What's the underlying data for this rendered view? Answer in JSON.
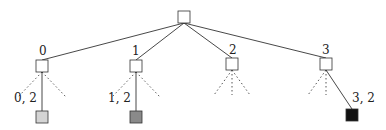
{
  "diagram": {
    "type": "tree",
    "root": {
      "x": 184,
      "y": 17,
      "size": 12,
      "fill": "#ffffff"
    },
    "children": [
      {
        "label": "0",
        "x": 42,
        "y": 66,
        "label_x": 39,
        "label_y": 55,
        "leaf": {
          "label": "0, 2",
          "x": 42,
          "y": 117,
          "fill": "#d4d4d4",
          "label_x": 14,
          "label_y": 102
        },
        "dotted": [
          [
            -24,
            25
          ],
          [
            24,
            25
          ]
        ]
      },
      {
        "label": "1",
        "x": 136,
        "y": 66,
        "label_x": 132,
        "label_y": 55,
        "leaf": {
          "label": "1, 2",
          "x": 136,
          "y": 117,
          "fill": "#8a8a8a",
          "label_x": 108,
          "label_y": 102
        },
        "dotted": [
          [
            -24,
            25
          ],
          [
            24,
            25
          ]
        ]
      },
      {
        "label": "2",
        "x": 232,
        "y": 64,
        "label_x": 229,
        "label_y": 54,
        "leaf": null,
        "dotted": [
          [
            -18,
            25
          ],
          [
            0,
            25
          ],
          [
            18,
            25
          ]
        ]
      },
      {
        "label": "3",
        "x": 326,
        "y": 64,
        "label_x": 322,
        "label_y": 54,
        "leaf": {
          "label": "3, 2",
          "x": 352,
          "y": 115,
          "fill": "#111111",
          "label_x": 352,
          "label_y": 102
        },
        "dotted": [
          [
            -18,
            25
          ],
          [
            0,
            25
          ]
        ]
      }
    ],
    "colors": {
      "edge": "#333333",
      "dotted": "#555555",
      "node_stroke": "#333333"
    }
  }
}
